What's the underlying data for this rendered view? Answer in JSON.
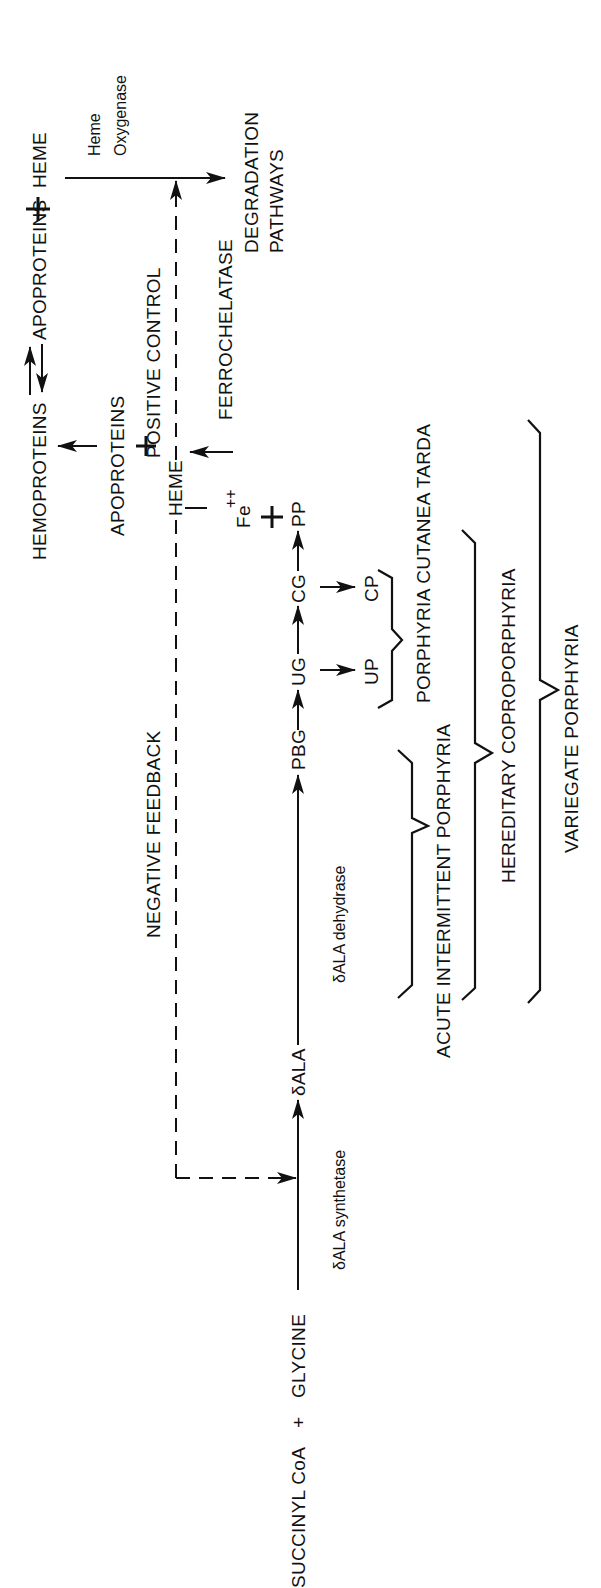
{
  "diagram": {
    "orientation": "rotated-90-ccw",
    "substrates": {
      "succinyl_coa": "SUCCINYL CoA",
      "plus": "+",
      "glycine": "GLYCINE"
    },
    "intermediates": {
      "dala": "δALA",
      "pbg": "PBG",
      "ug": "UG",
      "cg": "CG",
      "pp": "PP",
      "up": "UP",
      "cp": "CP",
      "heme": "HEME",
      "fe": "Fe",
      "fe_charge": "++"
    },
    "enzymes": {
      "dala_synthetase": "δALA synthetase",
      "dala_dehydrase": "δALA dehydrase",
      "ferrochelatase": "FERROCHELATASE",
      "heme_oxygenase_line1": "Heme",
      "heme_oxygenase_line2": "Oxygenase"
    },
    "regulation": {
      "negative_feedback": "NEGATIVE FEEDBACK",
      "positive_control": "POSITIVE CONTROL"
    },
    "proteins": {
      "apoproteins": "APOPROTEINS",
      "hemoproteins": "HEMOPROTEINS",
      "equilibrium_right": "APOPROTEINS",
      "heme_top": "HEME"
    },
    "degradation": {
      "line1": "DEGRADATION",
      "line2": "PATHWAYS"
    },
    "diseases": [
      {
        "label": "ACUTE INTERMITTENT PORPHYRIA",
        "span": "δALA→PBG"
      },
      {
        "label": "PORPHYRIA CUTANEA TARDA",
        "span": "UP–CP"
      },
      {
        "label": "HEREDITARY COPROPORPHYRIA",
        "span": "δALA→CG"
      },
      {
        "label": "VARIEGATE PORPHYRIA",
        "span": "δALA→PP"
      }
    ],
    "colors": {
      "ink": "#111111",
      "background": "#ffffff"
    }
  }
}
